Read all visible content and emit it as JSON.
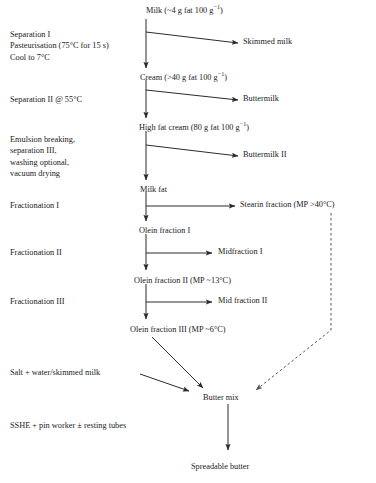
{
  "diagram": {
    "line_color": "#2b2b2b",
    "dashed_color": "#555555",
    "text_color": "#1a1a1a",
    "background": "#ffffff"
  },
  "stream_labels": {
    "milk": "Milk (~4 g fat 100 g",
    "milk_sup": "−1",
    "milk_tail": ")",
    "skimmed_milk": "Skimmed milk",
    "cream": "Cream (>40 g fat 100 g",
    "cream_sup": "−1",
    "cream_tail": ")",
    "buttermilk": "Buttermilk",
    "high_fat_cream": "High fat cream (80 g fat 100 g",
    "high_fat_cream_sup": "−1",
    "high_fat_cream_tail": ")",
    "buttermilk_ii": "Buttermilk II",
    "milk_fat": "Milk fat",
    "stearin_fraction": "Stearin fraction (MP >40°C)",
    "olein_fraction_i": "Olein fraction I",
    "midfraction_i": "Midfraction I",
    "olein_fraction_ii": "Olein fraction II (MP ~13°C)",
    "mid_fraction_ii": "Mid fraction II",
    "olein_fraction_iii": "Olein fraction III (MP ~6°C)",
    "butter_mix": "Butter mix",
    "spreadable_butter": "Spreadable butter"
  },
  "process_labels": {
    "separation_i_line1": "Separation I",
    "separation_i_line2": "Pasteurisation (75°C for 15 s)",
    "separation_i_line3": "Cool to 7°C",
    "separation_ii": "Separation II @ 55°C",
    "emulsion_line1": "Emulsion breaking,",
    "emulsion_line2": "separation III,",
    "emulsion_line3": "washing optional,",
    "emulsion_line4": "vacuum drying",
    "fractionation_i": "Fractionation I",
    "fractionation_ii": "Fractionation II",
    "fractionation_iii": "Fractionation III",
    "salt_water": "Salt + water/skimmed milk",
    "sshe": "SSHE + pin worker ± resting tubes"
  }
}
